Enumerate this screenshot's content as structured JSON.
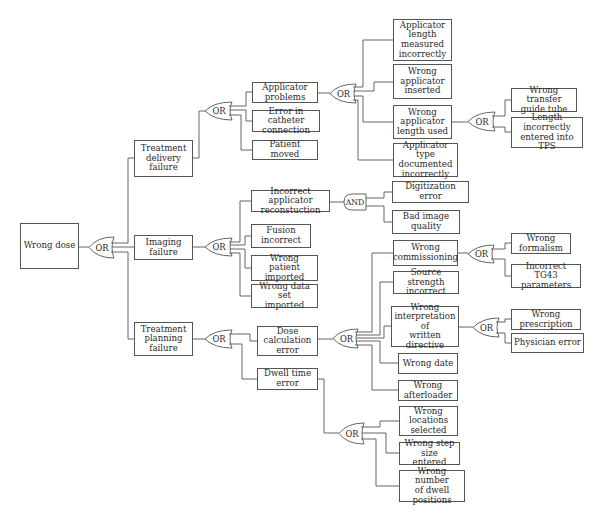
{
  "diagram": {
    "type": "fault-tree",
    "line_color": "#555555",
    "text_color": "#2a2a2a",
    "nodes": {
      "wrong_dose": "Wrong dose",
      "treatment_delivery_failure": "Treatment\ndelivery\nfailure",
      "imaging_failure": "Imaging\nfailure",
      "treatment_planning_failure": "Treatment\nplanning\nfailure",
      "applicator_problems": "Applicator\nproblems",
      "error_catheter_connection": "Error in catheter\nconnection",
      "patient_moved": "Patient moved",
      "applicator_length_measured": "Applicator\nlength\nmeasured\nincorrectly",
      "wrong_applicator_inserted": "Wrong\napplicator\ninserted",
      "wrong_applicator_length_used": "Wrong\napplicator\nlength used",
      "applicator_type_documented": "Applicator type\ndocumented\nincorrectly",
      "wrong_transfer_guide_tube": "Wrong transfer\nguide tube",
      "length_incorrectly_entered": "Length\nincorrectly\nentered into TPS",
      "incorrect_applicator_reconstruction": "Incorrect applicator\nreconstuction",
      "digitization_error": "Digitization error",
      "bad_image_quality": "Bad image\nquality",
      "fusion_incorrect": "Fusion\nincorrect",
      "wrong_patient_imported": "Wrong patient\nimported",
      "wrong_data_set_imported": "Wrong data set\nimported",
      "dose_calculation_error": "Dose\ncalculation\nerror",
      "dwell_time_error": "Dwell time\nerror",
      "wrong_commissioning": "Wrong\ncommissioning",
      "source_strength_incorrect": "Source strength\nincorrect",
      "wrong_interpretation": "Wrong\ninterpretation of\nwritten directive",
      "wrong_date": "Wrong date",
      "wrong_afterloader": "Wrong\nafterloader",
      "wrong_formalism": "Wrong\nformalism",
      "incorrect_tg43": "Incorrect TG43\nparameters",
      "wrong_prescription": "Wrong\nprescription",
      "physician_error": "Physician error",
      "wrong_locations_selected": "Wrong\nlocations\nselected",
      "wrong_step_size": "Wrong step size\nentered",
      "wrong_number_dwell_positions": "Wrong number\nof dwell\npositions"
    },
    "gates": {
      "g_root": "OR",
      "g_delivery": "OR",
      "g_applicator": "OR",
      "g_length_used": "OR",
      "g_imaging": "OR",
      "g_reconstruction": "AND",
      "g_planning": "OR",
      "g_dose_calc": "OR",
      "g_commissioning": "OR",
      "g_interpretation": "OR",
      "g_dwell": "OR"
    }
  }
}
